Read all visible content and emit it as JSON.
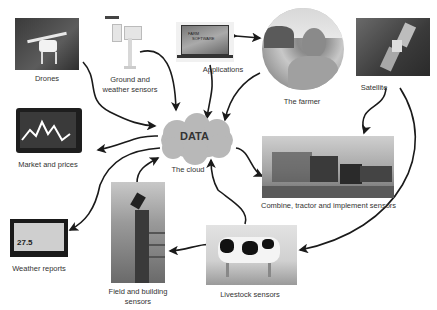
{
  "diagram": {
    "center": {
      "title": "DATA",
      "label": "The cloud"
    },
    "nodes": [
      {
        "id": "drones",
        "label": "Drones"
      },
      {
        "id": "ground",
        "label_line1": "Ground and",
        "label_line2": "weather sensors"
      },
      {
        "id": "applications",
        "label": "Applications",
        "screen_text_1": "FARM",
        "screen_text_2": "SOFTWARE"
      },
      {
        "id": "farmer",
        "label": "The farmer"
      },
      {
        "id": "satellite",
        "label": "Satellite"
      },
      {
        "id": "market",
        "label": "Market and prices"
      },
      {
        "id": "combine",
        "label": "Combine, tractor and implement sensors"
      },
      {
        "id": "weather",
        "label": "Weather reports",
        "display_text": "27.5"
      },
      {
        "id": "field",
        "label_line1": "Field and building",
        "label_line2": "sensors"
      },
      {
        "id": "livestock",
        "label": "Livestock sensors"
      }
    ]
  },
  "colors": {
    "cloud": "#b8b8b8",
    "arrow": "#1a1a1a",
    "label": "#333333"
  }
}
